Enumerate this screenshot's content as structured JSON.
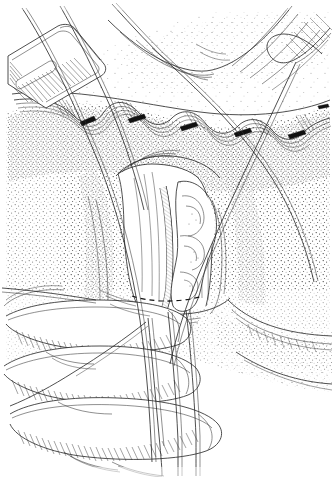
{
  "figure": {
    "medium": "pen-and-ink stipple illustration",
    "background_color": "#ffffff",
    "ink_color": "#1a1a1a",
    "width": 332,
    "height": 477,
    "caption": "",
    "labels": [],
    "visible_text": ""
  },
  "elements": {
    "retractor": {
      "name": "retractor-blade",
      "description": "flat surgical retractor blade with slot, upper left"
    },
    "incision": {
      "name": "incision-edge",
      "description": "transverse wound edge across upper third with everted skin flap"
    },
    "clips": {
      "name": "hemostatic-clips",
      "count": 5,
      "description": "dark clamps along the wound margin"
    },
    "cord_structure": {
      "name": "cord-structure",
      "description": "central tubular anatomical structure elevated between fingers"
    },
    "vessel_bundle": {
      "name": "vessel-bundle",
      "description": "convoluted vessels lateral to the cord"
    },
    "dashed_line": {
      "name": "dashed-division-line",
      "description": "dashed line marking the planned division"
    },
    "sutures": {
      "name": "suture-strands",
      "count": 6,
      "description": "long ligature strands running across and down the field"
    },
    "fingers": {
      "name": "gloved-fingers",
      "count": 3,
      "description": "gloved fingers entering from lower left retracting tissue"
    },
    "stipple_field": {
      "name": "stipple-shading",
      "description": "dotted tonal shading over the subcutaneous plane"
    }
  }
}
